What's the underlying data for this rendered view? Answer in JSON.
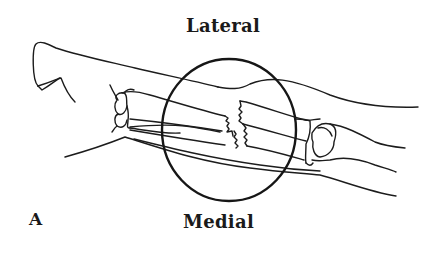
{
  "figure": {
    "panel_label": "A",
    "top_label": "Lateral",
    "bottom_label": "Medial",
    "highlight": "circle-around-fracture-site",
    "colors": {
      "line": "#1c1c1c",
      "background": "#ffffff"
    }
  }
}
